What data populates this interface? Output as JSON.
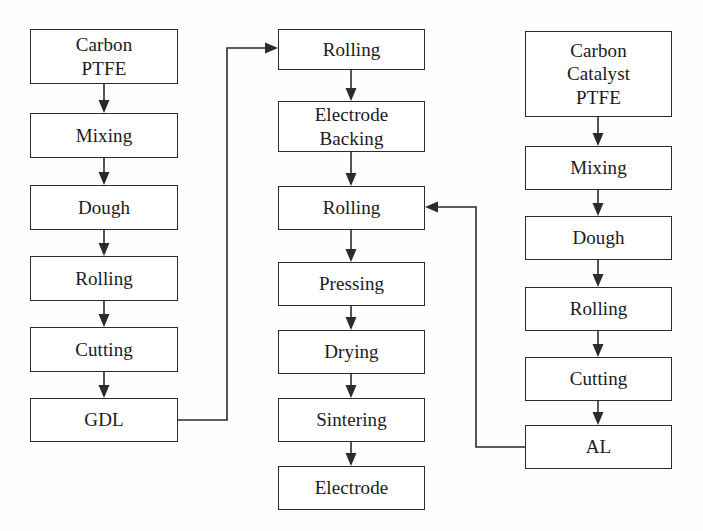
{
  "diagram": {
    "background_color": "#fefefe",
    "line_color": "#2b2b2b",
    "text_color": "#1a1a1a",
    "columns": [
      {
        "name": "gas-diffusion-layer-line",
        "nodes": [
          {
            "id": "l1",
            "label": "Carbon\nPTFE",
            "x": 30,
            "y": 29,
            "w": 148,
            "h": 55
          },
          {
            "id": "l2",
            "label": "Mixing",
            "x": 30,
            "y": 113,
            "w": 148,
            "h": 45
          },
          {
            "id": "l3",
            "label": "Dough",
            "x": 30,
            "y": 185,
            "w": 148,
            "h": 45
          },
          {
            "id": "l4",
            "label": "Rolling",
            "x": 30,
            "y": 256,
            "w": 148,
            "h": 45
          },
          {
            "id": "l5",
            "label": "Cutting",
            "x": 30,
            "y": 327,
            "w": 148,
            "h": 45
          },
          {
            "id": "l6",
            "label": "GDL",
            "x": 30,
            "y": 398,
            "w": 148,
            "h": 44
          }
        ]
      },
      {
        "name": "electrode-assembly-line",
        "nodes": [
          {
            "id": "m1",
            "label": "Rolling",
            "x": 278,
            "y": 29,
            "w": 147,
            "h": 41
          },
          {
            "id": "m2",
            "label": "Electrode\nBacking",
            "x": 278,
            "y": 101,
            "w": 147,
            "h": 51
          },
          {
            "id": "m3",
            "label": "Rolling",
            "x": 278,
            "y": 186,
            "w": 147,
            "h": 44
          },
          {
            "id": "m4",
            "label": "Pressing",
            "x": 278,
            "y": 262,
            "w": 147,
            "h": 44
          },
          {
            "id": "m5",
            "label": "Drying",
            "x": 278,
            "y": 330,
            "w": 147,
            "h": 44
          },
          {
            "id": "m6",
            "label": "Sintering",
            "x": 278,
            "y": 398,
            "w": 147,
            "h": 44
          },
          {
            "id": "m7",
            "label": "Electrode",
            "x": 278,
            "y": 466,
            "w": 147,
            "h": 44
          }
        ]
      },
      {
        "name": "active-layer-line",
        "nodes": [
          {
            "id": "r1",
            "label": "Carbon\nCatalyst\nPTFE",
            "x": 525,
            "y": 31,
            "w": 147,
            "h": 86
          },
          {
            "id": "r2",
            "label": "Mixing",
            "x": 525,
            "y": 146,
            "w": 147,
            "h": 44
          },
          {
            "id": "r3",
            "label": "Dough",
            "x": 525,
            "y": 216,
            "w": 147,
            "h": 44
          },
          {
            "id": "r4",
            "label": "Rolling",
            "x": 525,
            "y": 287,
            "w": 147,
            "h": 44
          },
          {
            "id": "r5",
            "label": "Cutting",
            "x": 525,
            "y": 357,
            "w": 147,
            "h": 44
          },
          {
            "id": "r6",
            "label": "AL",
            "x": 525,
            "y": 425,
            "w": 147,
            "h": 44
          }
        ]
      }
    ],
    "connectors": [
      {
        "name": "l1-to-l2",
        "type": "vertical-arrow",
        "x": 104,
        "y1": 84,
        "y2": 112
      },
      {
        "name": "l2-to-l3",
        "type": "vertical-arrow",
        "x": 104,
        "y1": 158,
        "y2": 184
      },
      {
        "name": "l3-to-l4",
        "type": "vertical-arrow",
        "x": 104,
        "y1": 230,
        "y2": 255
      },
      {
        "name": "l4-to-l5",
        "type": "vertical-arrow",
        "x": 104,
        "y1": 301,
        "y2": 326
      },
      {
        "name": "l5-to-l6",
        "type": "vertical-arrow",
        "x": 104,
        "y1": 372,
        "y2": 397
      },
      {
        "name": "m1-to-m2",
        "type": "vertical-arrow",
        "x": 351,
        "y1": 70,
        "y2": 100
      },
      {
        "name": "m2-to-m3",
        "type": "vertical-arrow",
        "x": 351,
        "y1": 152,
        "y2": 185
      },
      {
        "name": "m3-to-m4",
        "type": "vertical-arrow",
        "x": 351,
        "y1": 230,
        "y2": 261
      },
      {
        "name": "m4-to-m5",
        "type": "vertical-arrow",
        "x": 351,
        "y1": 306,
        "y2": 329
      },
      {
        "name": "m5-to-m6",
        "type": "vertical-arrow",
        "x": 351,
        "y1": 374,
        "y2": 397
      },
      {
        "name": "m6-to-m7",
        "type": "vertical-arrow",
        "x": 351,
        "y1": 442,
        "y2": 465
      },
      {
        "name": "r1-to-r2",
        "type": "vertical-arrow",
        "x": 598,
        "y1": 117,
        "y2": 145
      },
      {
        "name": "r2-to-r3",
        "type": "vertical-arrow",
        "x": 598,
        "y1": 190,
        "y2": 215
      },
      {
        "name": "r3-to-r4",
        "type": "vertical-arrow",
        "x": 598,
        "y1": 260,
        "y2": 286
      },
      {
        "name": "r4-to-r5",
        "type": "vertical-arrow",
        "x": 598,
        "y1": 331,
        "y2": 356
      },
      {
        "name": "r5-to-r6",
        "type": "vertical-arrow",
        "x": 598,
        "y1": 401,
        "y2": 424
      },
      {
        "name": "gdl-to-rolling",
        "type": "elbow-arrow",
        "path": "M 178 420 L 227 420 L 227 48 L 270 48",
        "arrow_at": "right"
      },
      {
        "name": "al-to-rolling",
        "type": "elbow-arrow",
        "path": "M 525 447 L 476 447 L 476 207 L 433 207",
        "arrow_at": "left"
      }
    ]
  }
}
